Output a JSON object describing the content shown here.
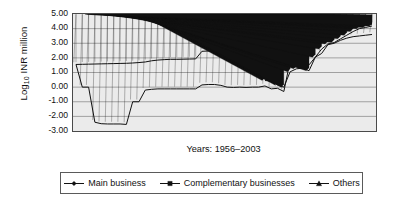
{
  "chart_data": {
    "type": "line",
    "title": "",
    "subtitle": "",
    "xlabel": "Years: 1956–2003",
    "ylabel": "Log10 INR million",
    "ylabel_base": "Log",
    "ylabel_sub": "10",
    "ylabel_rest": " INR million",
    "xlim": [
      1956,
      2003
    ],
    "ylim": [
      -3.0,
      5.0
    ],
    "ytick_labels": [
      "5.00",
      "4.00",
      "3.00",
      "2.00",
      "1.00",
      "0.00",
      "-1.00",
      "-2.00",
      "-3.00"
    ],
    "ytick_values": [
      5,
      4,
      3,
      2,
      1,
      0,
      -1,
      -2,
      -3
    ],
    "xtick_labels": [],
    "grid": "horizontal",
    "plot_background": "#ebebeb",
    "legend_position": "bottom",
    "x": [
      1956,
      1957,
      1958,
      1959,
      1960,
      1961,
      1962,
      1963,
      1964,
      1965,
      1966,
      1967,
      1968,
      1969,
      1970,
      1971,
      1972,
      1973,
      1974,
      1975,
      1976,
      1977,
      1978,
      1979,
      1980,
      1981,
      1982,
      1983,
      1984,
      1985,
      1986,
      1987,
      1988,
      1989,
      1990,
      1991,
      1992,
      1993,
      1994,
      1995,
      1996,
      1997,
      1998,
      1999,
      2000,
      2001,
      2002,
      2003
    ],
    "series": [
      {
        "name": "Main business",
        "marker": "diamond",
        "color": "#111111",
        "values": [
          1.55,
          1.56,
          1.57,
          1.58,
          1.59,
          1.6,
          1.61,
          1.62,
          1.63,
          1.65,
          1.68,
          1.72,
          1.8,
          1.85,
          1.88,
          1.9,
          1.9,
          1.91,
          1.92,
          1.93,
          2.45,
          2.47,
          2.5,
          2.55,
          2.6,
          2.66,
          2.72,
          2.8,
          2.9,
          3.0,
          3.12,
          3.06,
          3.08,
          3.12,
          3.22,
          3.28,
          3.34,
          3.4,
          3.45,
          3.52,
          3.6,
          3.72,
          3.85,
          3.98,
          4.1,
          4.16,
          4.2,
          4.3
        ]
      },
      {
        "name": "Complementary businesses",
        "marker": "square",
        "color": "#111111",
        "values": [
          1.55,
          0.0,
          0.0,
          -2.4,
          -2.5,
          -2.52,
          -2.52,
          -2.52,
          -2.55,
          -1.0,
          -1.0,
          -0.2,
          -0.15,
          -0.12,
          -0.12,
          -0.12,
          -0.12,
          -0.12,
          -0.12,
          -0.12,
          0.15,
          0.18,
          0.18,
          0.12,
          0.0,
          -0.02,
          0.0,
          -0.02,
          0.0,
          0.0,
          0.08,
          -0.12,
          -0.08,
          -0.3,
          1.78,
          1.8,
          1.8,
          1.52,
          2.05,
          2.3,
          2.9,
          3.0,
          3.2,
          3.35,
          3.45,
          3.5,
          3.55,
          3.6
        ]
      },
      {
        "name": "Others",
        "marker": "triangle",
        "color": "#111111",
        "values": [
          null,
          null,
          null,
          null,
          null,
          null,
          null,
          null,
          null,
          null,
          null,
          null,
          null,
          null,
          null,
          null,
          null,
          null,
          null,
          null,
          null,
          null,
          null,
          null,
          null,
          null,
          null,
          null,
          null,
          null,
          0.45,
          0.42,
          0.15,
          0.0,
          1.05,
          1.25,
          1.3,
          1.12,
          2.05,
          2.6,
          2.95,
          3.05,
          3.3,
          3.55,
          3.8,
          4.0,
          4.08,
          4.18
        ]
      }
    ]
  },
  "axis": {
    "y_title_base": "Log",
    "y_title_sub": "10",
    "y_title_rest": " INR million",
    "x_title": "Years: 1956–2003"
  },
  "legend": {
    "items": [
      {
        "label": "Main business",
        "marker": "diamond-marker-icon"
      },
      {
        "label": "Complementary businesses",
        "marker": "square-marker-icon"
      },
      {
        "label": "Others",
        "marker": "triangle-marker-icon"
      }
    ]
  }
}
